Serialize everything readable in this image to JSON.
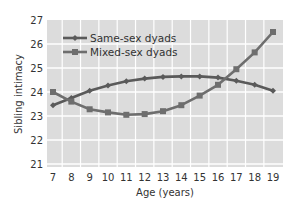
{
  "chart_data": {
    "type": "line",
    "title": "",
    "xlabel": "Age (years)",
    "ylabel": "Sibling intimacy",
    "x": [
      7,
      8,
      9,
      10,
      11,
      12,
      13,
      14,
      15,
      16,
      17,
      18,
      19
    ],
    "x_tick_labels": [
      "7",
      "8",
      "9",
      "10",
      "11",
      "12",
      "13",
      "14",
      "15",
      "16",
      "17",
      "18",
      "19"
    ],
    "y_tick_labels": [
      "21",
      "22",
      "23",
      "24",
      "25",
      "26",
      "27"
    ],
    "ylim": [
      21,
      27
    ],
    "xlim": [
      6.7,
      19.55
    ],
    "grid": true,
    "legend_position": "upper left",
    "series": [
      {
        "name": "Same-sex dyads",
        "marker": "diamond",
        "color": "#5a5a5a",
        "values": [
          23.45,
          23.75,
          24.05,
          24.27,
          24.45,
          24.56,
          24.63,
          24.65,
          24.65,
          24.6,
          24.47,
          24.3,
          24.05
        ]
      },
      {
        "name": "Mixed-sex dyads",
        "marker": "square",
        "color": "#6e6e6e",
        "values": [
          24.0,
          23.6,
          23.28,
          23.15,
          23.05,
          23.08,
          23.2,
          23.45,
          23.85,
          24.3,
          24.95,
          25.65,
          26.5
        ]
      }
    ]
  },
  "colors": {
    "plot_background": "#dcdcdc",
    "gridline": "#ffffff",
    "text": "#333333"
  }
}
